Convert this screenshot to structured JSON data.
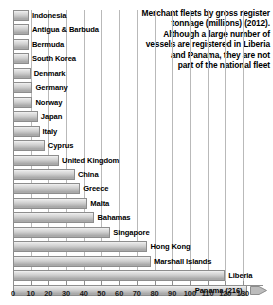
{
  "chart_data": {
    "type": "bar",
    "orientation": "horizontal",
    "title": "Merchant fleets by gross register tonnage (millions) (2012). Although a large number of vessels are registered in Liberia and Panama, they are not part of the national fleet",
    "title_lines": [
      "Merchant fleets by gross register",
      "tonnage (millions) (2012).",
      "Although a large number of",
      "vessels are registered in Liberia",
      "and Panama, they are not",
      "part of the national fleet"
    ],
    "xlabel": "",
    "ylabel": "",
    "xlim": [
      0,
      130
    ],
    "xticks": [
      0,
      10,
      20,
      30,
      40,
      50,
      60,
      70,
      80,
      90,
      100,
      110,
      120,
      130
    ],
    "grid": true,
    "legend": false,
    "units": "millions of gross register tonnage",
    "categories": [
      "Indonesia",
      "Antigua & Barbuda",
      "Bermuda",
      "South Korea",
      "Denmark",
      "Germany",
      "Norway",
      "Japan",
      "Italy",
      "Cyprus",
      "United Kingdom",
      "China",
      "Greece",
      "Malta",
      "Bahamas",
      "Singapore",
      "Hong Kong",
      "Marshall Islands",
      "Panama"
    ],
    "values": [
      9,
      9,
      9,
      9,
      10,
      11,
      11,
      14,
      15,
      18,
      26,
      35,
      38,
      42,
      46,
      55,
      76,
      78,
      216
    ],
    "bars": [
      {
        "label": "Indonesia",
        "value": 9,
        "label_position": "outside",
        "overflow": false
      },
      {
        "label": "Antigua & Barbuda",
        "value": 9,
        "label_position": "outside",
        "overflow": false
      },
      {
        "label": "Bermuda",
        "value": 9,
        "label_position": "outside",
        "overflow": false
      },
      {
        "label": "South Korea",
        "value": 9,
        "label_position": "outside",
        "overflow": false
      },
      {
        "label": "Denmark",
        "value": 10,
        "label_position": "outside",
        "overflow": false
      },
      {
        "label": "Germany",
        "value": 11,
        "label_position": "outside",
        "overflow": false
      },
      {
        "label": "Norway",
        "value": 11,
        "label_position": "outside",
        "overflow": false
      },
      {
        "label": "Japan",
        "value": 14,
        "label_position": "outside",
        "overflow": false
      },
      {
        "label": "Italy",
        "value": 15,
        "label_position": "outside",
        "overflow": false
      },
      {
        "label": "Cyprus",
        "value": 18,
        "label_position": "outside",
        "overflow": false
      },
      {
        "label": "United Kingdom",
        "value": 26,
        "label_position": "outside",
        "overflow": false
      },
      {
        "label": "China",
        "value": 35,
        "label_position": "outside",
        "overflow": false
      },
      {
        "label": "Greece",
        "value": 38,
        "label_position": "outside",
        "overflow": false
      },
      {
        "label": "Malta",
        "value": 42,
        "label_position": "outside",
        "overflow": false
      },
      {
        "label": "Bahamas",
        "value": 46,
        "label_position": "outside",
        "overflow": false
      },
      {
        "label": "Singapore",
        "value": 55,
        "label_position": "outside",
        "overflow": false
      },
      {
        "label": "Hong Kong",
        "value": 76,
        "label_position": "outside",
        "overflow": false
      },
      {
        "label": "Marshall Islands",
        "value": 78,
        "label_position": "outside",
        "overflow": false
      },
      {
        "label": "Liberia",
        "value": 120,
        "label_position": "outside",
        "overflow": false
      },
      {
        "label": "Panama (216)",
        "value": 216,
        "label_position": "inside",
        "overflow": true
      }
    ],
    "note": "Panama bar is truncated at the axis maximum and marked with an arrowhead; its true value is 216",
    "colors": {
      "bar_fill_light": "#f2f2f2",
      "bar_fill_dark": "#a2a2a2",
      "bar_border": "#8d8d8d",
      "gridline": "#b9b9b9",
      "axis": "#8f8f8f",
      "text": "#000000",
      "background": "#ffffff"
    }
  }
}
